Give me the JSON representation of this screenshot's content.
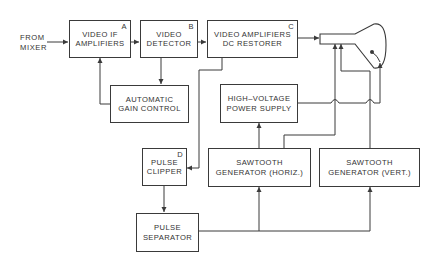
{
  "input_label": {
    "line1": "FROM",
    "line2": "MIXER"
  },
  "blocks": {
    "video_if": {
      "tag": "A",
      "line1": "VIDEO IF",
      "line2": "AMPLIFIERS"
    },
    "video_detector": {
      "tag": "B",
      "line1": "VIDEO",
      "line2": "DETECTOR"
    },
    "video_amps": {
      "tag": "C",
      "line1": "VIDEO AMPLIFIERS",
      "line2": "DC RESTORER"
    },
    "agc": {
      "line1": "AUTOMATIC",
      "line2": "GAIN CONTROL"
    },
    "hv_supply": {
      "line1": "HIGH–VOLTAGE",
      "line2": "POWER SUPPLY"
    },
    "pulse_clipper": {
      "tag": "D",
      "line1": "PULSE",
      "line2": "CLIPPER"
    },
    "saw_horiz": {
      "line1": "SAWTOOTH",
      "line2": "GENERATOR (HORIZ.)"
    },
    "saw_vert": {
      "line1": "SAWTOOTH",
      "line2": "GENERATOR (VERT.)"
    },
    "pulse_separator": {
      "line1": "PULSE",
      "line2": "SEPARATOR"
    }
  },
  "output_device": "crt-picture-tube",
  "colors": {
    "line": "#3a3a3a",
    "background": "#ffffff"
  }
}
